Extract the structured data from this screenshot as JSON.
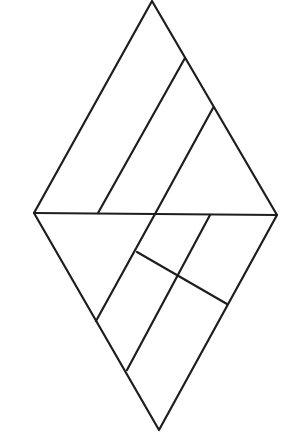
{
  "diagram": {
    "type": "geometric-figure",
    "stroke_color": "#1e1e1e",
    "background": "#ffffff",
    "outline": {
      "vertices": [
        [
          152,
          1
        ],
        [
          277,
          215
        ],
        [
          159,
          430
        ],
        [
          34,
          213
        ]
      ]
    },
    "segments": [
      {
        "name": "horizontal-diagonal",
        "from": [
          34,
          213
        ],
        "to": [
          277,
          215
        ]
      },
      {
        "name": "upper-parallel-1",
        "from": [
          185,
          58
        ],
        "to": [
          98,
          213
        ]
      },
      {
        "name": "upper-parallel-2",
        "from": [
          213,
          108
        ],
        "to": [
          155,
          214
        ]
      },
      {
        "name": "lower-parallel-1",
        "from": [
          155,
          214
        ],
        "to": [
          96,
          321
        ]
      },
      {
        "name": "lower-parallel-2",
        "from": [
          210,
          215
        ],
        "to": [
          127,
          370
        ]
      },
      {
        "name": "lower-crossbar",
        "from": [
          137,
          252
        ],
        "to": [
          227,
          304
        ]
      }
    ]
  }
}
